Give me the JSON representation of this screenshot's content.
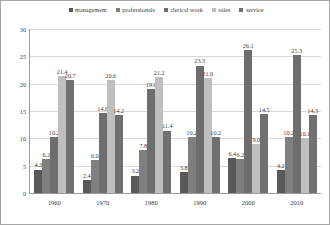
{
  "chart_data": {
    "type": "bar",
    "title": "",
    "xlabel": "",
    "ylabel": "",
    "ylim": [
      0,
      30
    ],
    "yticks": [
      30,
      25,
      20,
      15,
      10,
      5,
      0
    ],
    "grid": true,
    "legend_position": "top-center",
    "categories": [
      "1960",
      "1970",
      "1980",
      "1990",
      "2000",
      "2010"
    ],
    "series": [
      {
        "name": "management",
        "color": "#595959",
        "values": [
          4.3,
          2.4,
          3.2,
          3.8,
          6.4,
          4.2
        ]
      },
      {
        "name": "professionals",
        "color": "#7f7f7f",
        "values": [
          6.2,
          6.0,
          7.8,
          10.2,
          6.2,
          10.2
        ]
      },
      {
        "name": "clerical work",
        "color": "#6e6e6e",
        "values": [
          10.2,
          14.6,
          19.0,
          23.3,
          26.1,
          25.3
        ]
      },
      {
        "name": "sales",
        "color": "#bfbfbf",
        "values": [
          21.4,
          20.6,
          21.2,
          21.0,
          9.0,
          10.1
        ]
      },
      {
        "name": "service",
        "color": "#707070",
        "values": [
          20.7,
          14.2,
          11.4,
          10.2,
          14.5,
          14.3
        ]
      }
    ]
  },
  "style": {
    "plot_background": "#ffffff",
    "border_color": "#a6a6a6",
    "gridline_color": "#d9d9d9",
    "axis_color": "#9a9a9a",
    "label_color": "#3d3d3d"
  }
}
